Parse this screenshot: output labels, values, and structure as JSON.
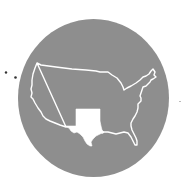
{
  "figure": {
    "colors": {
      "background": "#ffffff",
      "circle": "#8e8e8e",
      "outline": "#ffffff",
      "highlight": "#ffffff",
      "dots": "#333333",
      "stray_mark": "#bbbbbb"
    },
    "highlighted_region": "Texas and Oklahoma",
    "decorative_dots": 2
  }
}
